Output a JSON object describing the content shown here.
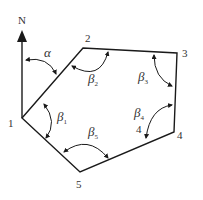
{
  "diagram": {
    "north_label": "N",
    "vertices": [
      {
        "id": "1",
        "label": "1",
        "x": 22,
        "y": 118
      },
      {
        "id": "2",
        "label": "2",
        "x": 83,
        "y": 48
      },
      {
        "id": "3",
        "label": "3",
        "x": 177,
        "y": 53
      },
      {
        "id": "4",
        "label": "4",
        "x": 174,
        "y": 132
      },
      {
        "id": "5",
        "label": "5",
        "x": 80,
        "y": 172
      }
    ],
    "angles": {
      "alpha": {
        "symbol": "α"
      },
      "beta1": {
        "symbol": "β",
        "sub": "1"
      },
      "beta2": {
        "symbol": "β",
        "sub": "2"
      },
      "beta3": {
        "symbol": "β",
        "sub": "3"
      },
      "beta4": {
        "symbol": "β",
        "sub": "4"
      },
      "beta5": {
        "symbol": "β",
        "sub": "5"
      }
    },
    "extra_label_4": "4",
    "stroke_color": "#1a1a1a"
  }
}
